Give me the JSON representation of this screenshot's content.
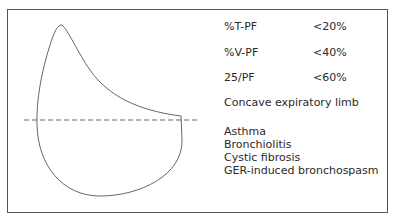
{
  "figure": {
    "criteria": [
      {
        "param": "%T-PF",
        "value": "<20%"
      },
      {
        "param": "%V-PF",
        "value": "<40%"
      },
      {
        "param": "25/PF",
        "value": "<60%"
      }
    ],
    "note": "Concave expiratory limb",
    "conditions": [
      "Asthma",
      "Bronchiolitis",
      "Cystic fibrosis",
      "GER-induced bronchospasm"
    ],
    "colors": {
      "border": "#555555",
      "curve": "#666666",
      "text": "#2a2a2a"
    }
  }
}
